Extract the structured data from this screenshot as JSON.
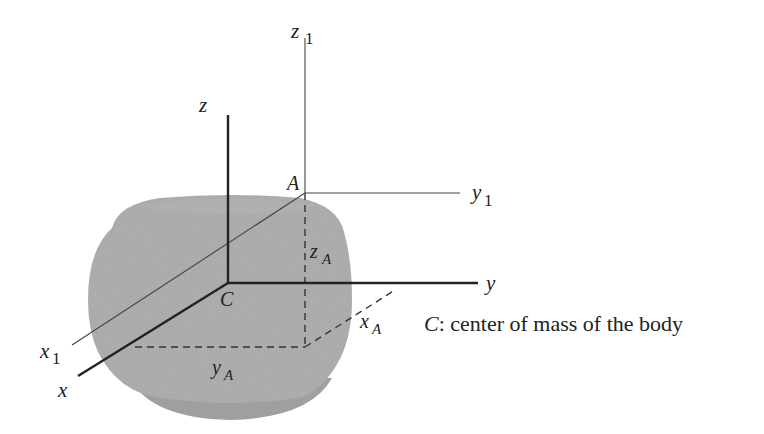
{
  "figure": {
    "body": {
      "fill": "#a9a9a9",
      "shadow": "#9a9a9a"
    },
    "labels": {
      "z": "z",
      "z1_main": "z",
      "z1_sub": "1",
      "y": "y",
      "y1_main": "y",
      "y1_sub": "1",
      "x": "x",
      "x1_main": "x",
      "x1_sub": "1",
      "A": "A",
      "C": "C",
      "zA_main": "z",
      "zA_sub": "A",
      "yA_main": "y",
      "yA_sub": "A",
      "xA_main": "x",
      "xA_sub": "A"
    },
    "caption": {
      "symbol": "C",
      "text": ": center of mass of the body"
    }
  }
}
